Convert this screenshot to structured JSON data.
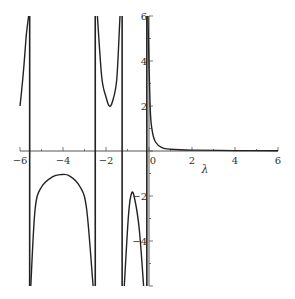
{
  "chart_data": {
    "type": "line",
    "title": "",
    "xlabel": "λ",
    "ylabel": "",
    "xlim": [
      -6,
      6
    ],
    "ylim": [
      -6,
      6
    ],
    "grid": false,
    "legend": null,
    "x_ticks": [
      -6,
      -4,
      -2,
      0,
      2,
      4,
      6
    ],
    "x_tick_labels": [
      "-6",
      "-4",
      "-2",
      "0",
      "2",
      "4",
      "6"
    ],
    "y_ticks": [
      6,
      4,
      2,
      -2,
      -4
    ],
    "y_tick_labels": [
      "6",
      "4",
      "2",
      "-2",
      "-4"
    ],
    "vertical_asymptotes": [
      -5.55,
      -2.5,
      -1.25,
      -0.1
    ],
    "series": [
      {
        "name": "branch-1",
        "points": [
          [
            -6.0,
            2.0
          ],
          [
            -5.9,
            2.9
          ],
          [
            -5.8,
            4.0
          ],
          [
            -5.7,
            5.2
          ],
          [
            -5.6,
            6.0
          ]
        ]
      },
      {
        "name": "branch-2",
        "points": [
          [
            -5.5,
            -6.0
          ],
          [
            -5.3,
            -2.6
          ],
          [
            -5.0,
            -1.6
          ],
          [
            -4.5,
            -1.15
          ],
          [
            -4.1,
            -1.05
          ],
          [
            -3.7,
            -1.1
          ],
          [
            -3.2,
            -1.6
          ],
          [
            -2.9,
            -2.6
          ],
          [
            -2.6,
            -6.0
          ]
        ]
      },
      {
        "name": "branch-3",
        "points": [
          [
            -2.4,
            6.0
          ],
          [
            -2.2,
            3.3
          ],
          [
            -2.0,
            2.4
          ],
          [
            -1.85,
            2.0
          ],
          [
            -1.7,
            2.2
          ],
          [
            -1.5,
            3.2
          ],
          [
            -1.35,
            6.0
          ]
        ]
      },
      {
        "name": "branch-4",
        "points": [
          [
            -1.15,
            -6.0
          ],
          [
            -0.95,
            -2.8
          ],
          [
            -0.8,
            -1.85
          ],
          [
            -0.65,
            -2.2
          ],
          [
            -0.45,
            -3.5
          ],
          [
            -0.25,
            -6.0
          ]
        ]
      },
      {
        "name": "branch-5",
        "points": [
          [
            -0.05,
            6.0
          ],
          [
            0.05,
            2.0
          ],
          [
            0.15,
            0.9
          ],
          [
            0.3,
            0.4
          ],
          [
            0.6,
            0.15
          ],
          [
            1.0,
            0.08
          ],
          [
            2.0,
            0.04
          ],
          [
            4.0,
            0.02
          ],
          [
            6.0,
            0.01
          ]
        ]
      }
    ]
  }
}
